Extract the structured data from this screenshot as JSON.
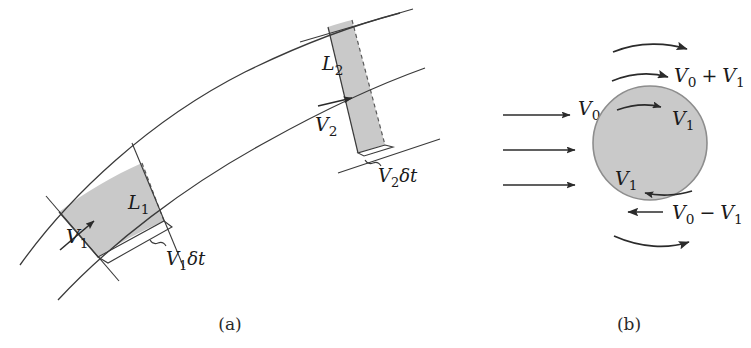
{
  "figure": {
    "type": "scientific-diagram",
    "background_color": "#ffffff",
    "line_color": "#3a3a3a",
    "fill_color": "#c9c9c9",
    "text_color": "#1a1a1a"
  },
  "panel_a": {
    "caption": "(a)",
    "labels": {
      "length_1": "L",
      "length_1_sub": "1",
      "length_2": "L",
      "length_2_sub": "2",
      "velocity_1": "V",
      "velocity_1_sub": "1",
      "velocity_2": "V",
      "velocity_2_sub": "2",
      "displacement_1_v": "V",
      "displacement_1_sub": "1",
      "displacement_1_dt": "δt",
      "displacement_2_v": "V",
      "displacement_2_sub": "2",
      "displacement_2_dt": "δt"
    }
  },
  "panel_b": {
    "caption": "(b)",
    "labels": {
      "freestream": "V",
      "freestream_sub": "0",
      "top_surface_v0": "V",
      "top_surface_sub0": "0",
      "top_plus": "+",
      "top_surface_v1": "V",
      "top_surface_sub1": "1",
      "inner_top_v1": "V",
      "inner_top_sub": "1",
      "inner_bottom_v1": "V",
      "inner_bottom_sub": "1",
      "bottom_surface_v0": "V",
      "bottom_surface_sub0": "0",
      "bottom_minus": "−",
      "bottom_surface_v1": "V",
      "bottom_surface_sub1": "1"
    },
    "inflow_arrow_count": 3
  }
}
